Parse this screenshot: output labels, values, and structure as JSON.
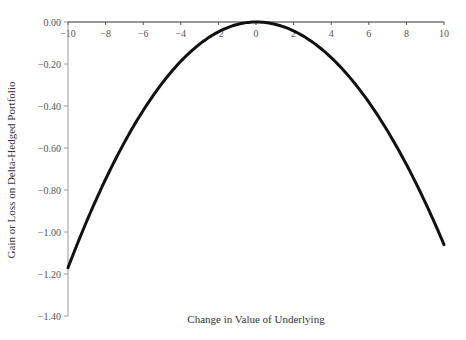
{
  "chart_data": {
    "type": "line",
    "title": "",
    "xlabel": "Change in Value of Underlying",
    "ylabel": "Gain or Loss on Delta-Hedged Portfolio",
    "xlim": [
      -10,
      10
    ],
    "ylim": [
      -1.4,
      0.0
    ],
    "grid": false,
    "legend": null,
    "x_ticks": [
      "-10",
      "-8",
      "-6",
      "-4",
      "-2",
      "0",
      "2",
      "4",
      "6",
      "8",
      "10"
    ],
    "y_ticks": [
      "0.00",
      "-0.20",
      "-0.40",
      "-0.60",
      "-0.80",
      "-1.00",
      "-1.20",
      "-1.40"
    ],
    "x_axis_position": "top (at y = 0)",
    "series": [
      {
        "name": "Delta-hedged portfolio P&L",
        "color": "#111111",
        "x": [
          -10,
          -9,
          -8,
          -7,
          -6,
          -5,
          -4,
          -3,
          -2,
          -1,
          0,
          1,
          2,
          3,
          4,
          5,
          6,
          7,
          8,
          9,
          10
        ],
        "values": [
          -1.17,
          -0.95,
          -0.75,
          -0.58,
          -0.42,
          -0.29,
          -0.19,
          -0.1,
          -0.045,
          -0.011,
          0.0,
          -0.011,
          -0.043,
          -0.096,
          -0.17,
          -0.265,
          -0.38,
          -0.52,
          -0.68,
          -0.86,
          -1.06
        ]
      }
    ]
  },
  "labels": {
    "xlabel": "Change in Value of Underlying",
    "ylabel": "Gain or Loss on Delta-Hedged Portfolio"
  },
  "colors": {
    "curve": "#111111",
    "axis": "#888888",
    "text": "#444444"
  }
}
